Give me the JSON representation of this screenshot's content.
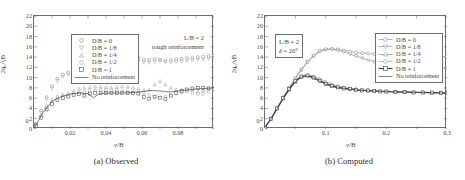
{
  "figure": {
    "panels": [
      {
        "id": "observed",
        "caption": "(a) Observed",
        "annotations": [
          "L/B = 2",
          "rough reinforcement"
        ],
        "axes": {
          "ylabel_main": "2q",
          "ylabel_sub": "u",
          "ylabel_tail": "/γB",
          "xlabel_main": "v",
          "xlabel_tail": "/B",
          "yticks": [
            0,
            2,
            4,
            6,
            8,
            10,
            12,
            14,
            16,
            18,
            20,
            22
          ],
          "xticks": [
            "0.02",
            "0.04",
            "0.06",
            "0.08"
          ]
        },
        "legend": [
          {
            "label": "D/B = 0",
            "marker": "circle",
            "line": false
          },
          {
            "label": "D/B = 1/8",
            "marker": "triangle-down",
            "line": false
          },
          {
            "label": "D/B = 1/4",
            "marker": "triangle-up",
            "line": false
          },
          {
            "label": "D/B = 1/2",
            "marker": "circle",
            "line": false
          },
          {
            "label": "D/B = 1",
            "marker": "square",
            "line": false
          },
          {
            "label": "No reinforcement",
            "marker": "none",
            "line": true
          }
        ]
      },
      {
        "id": "computed",
        "caption": "(b) Computed",
        "annotations": [
          "L/B = 2",
          "δ = 20°"
        ],
        "axes": {
          "ylabel_main": "2q",
          "ylabel_sub": "u",
          "ylabel_tail": "/γB",
          "xlabel_main": "v",
          "xlabel_tail": "/B",
          "yticks": [
            0,
            2,
            4,
            6,
            8,
            10,
            12,
            14,
            16,
            18,
            20,
            22
          ],
          "xticks": [
            "0.1",
            "0.2",
            "0.3"
          ]
        },
        "legend": [
          {
            "label": "D/B = 0",
            "marker": "circle",
            "line": true
          },
          {
            "label": "D/B = 1/8",
            "marker": "triangle-down",
            "line": true
          },
          {
            "label": "D/B = 1/4",
            "marker": "triangle-up",
            "line": true
          },
          {
            "label": "D/B = 1/2",
            "marker": "circle",
            "line": true
          },
          {
            "label": "D/B = 1",
            "marker": "square",
            "line": true
          },
          {
            "label": "No reinforcement",
            "marker": "none",
            "line": true
          }
        ]
      }
    ]
  },
  "chart_data": [
    {
      "type": "scatter",
      "panel": "(a) Observed",
      "title": "",
      "xlabel": "v/B",
      "ylabel": "2q_u/γB",
      "xlim": [
        0,
        0.1
      ],
      "ylim": [
        0,
        22
      ],
      "xticks": [
        0.02,
        0.04,
        0.06,
        0.08
      ],
      "yticks": [
        0,
        2,
        4,
        6,
        8,
        10,
        12,
        14,
        16,
        18,
        20,
        22
      ],
      "grid": false,
      "legend_position": "top-left",
      "annotations": [
        "L/B = 2",
        "rough reinforcement"
      ],
      "series": [
        {
          "name": "D/B = 0",
          "marker": "circle",
          "color": "#8a8a8a",
          "x": [
            0.001,
            0.004,
            0.007,
            0.01,
            0.013,
            0.016,
            0.019,
            0.022,
            0.025,
            0.028,
            0.031,
            0.034,
            0.037,
            0.04,
            0.043,
            0.046,
            0.049,
            0.052,
            0.055,
            0.058,
            0.061,
            0.064,
            0.067,
            0.07,
            0.073,
            0.076,
            0.079,
            0.082,
            0.085,
            0.088,
            0.091,
            0.094,
            0.097,
            0.1
          ],
          "y": [
            1.0,
            3.6,
            6.2,
            8.3,
            9.8,
            10.6,
            11.0,
            11.3,
            11.6,
            11.8,
            12.0,
            12.2,
            12.3,
            12.5,
            12.6,
            12.8,
            13.0,
            13.1,
            13.2,
            13.4,
            13.5,
            13.5,
            13.6,
            13.4,
            13.2,
            13.4,
            13.6,
            13.7,
            13.8,
            13.9,
            14.0,
            14.1,
            14.2,
            14.3
          ]
        },
        {
          "name": "D/B = 1/8",
          "marker": "triangle-down",
          "color": "#9a9a9a",
          "x": [
            0.001,
            0.004,
            0.007,
            0.01,
            0.013,
            0.016,
            0.019,
            0.022,
            0.025,
            0.028,
            0.031,
            0.034,
            0.037,
            0.04,
            0.043,
            0.046,
            0.049,
            0.052,
            0.055,
            0.058,
            0.061,
            0.064,
            0.067,
            0.07,
            0.073,
            0.076,
            0.079,
            0.082,
            0.085,
            0.088,
            0.091,
            0.094,
            0.097,
            0.1
          ],
          "y": [
            0.9,
            3.2,
            5.8,
            7.9,
            9.4,
            10.2,
            10.6,
            10.9,
            11.2,
            11.4,
            11.6,
            11.8,
            11.9,
            12.1,
            12.3,
            12.5,
            12.7,
            12.8,
            13.0,
            13.8,
            13.0,
            12.9,
            13.1,
            13.5,
            13.2,
            13.0,
            13.1,
            13.2,
            13.3,
            13.4,
            13.5,
            13.6,
            13.7,
            13.8
          ]
        },
        {
          "name": "D/B = 1/4",
          "marker": "triangle-up",
          "color": "#9a9a9a",
          "x": [
            0.001,
            0.004,
            0.007,
            0.01,
            0.013,
            0.016,
            0.019,
            0.022,
            0.025,
            0.028,
            0.031,
            0.034,
            0.037,
            0.04,
            0.043,
            0.046,
            0.049,
            0.052,
            0.055,
            0.058,
            0.061,
            0.064,
            0.067,
            0.07,
            0.073,
            0.076,
            0.079,
            0.082,
            0.085,
            0.088,
            0.091,
            0.094,
            0.097,
            0.1
          ],
          "y": [
            0.8,
            2.8,
            4.6,
            5.8,
            6.4,
            6.7,
            6.9,
            7.4,
            7.8,
            8.0,
            8.1,
            8.2,
            8.2,
            8.1,
            8.0,
            8.1,
            8.2,
            8.2,
            8.0,
            7.8,
            7.5,
            7.6,
            8.6,
            9.3,
            8.6,
            8.0,
            7.7,
            7.6,
            7.5,
            7.4,
            7.3,
            7.5,
            7.8,
            8.0
          ]
        },
        {
          "name": "D/B = 1/2",
          "marker": "circle",
          "color": "#a5a5a5",
          "x": [
            0.001,
            0.004,
            0.007,
            0.01,
            0.013,
            0.016,
            0.019,
            0.022,
            0.025,
            0.028,
            0.031,
            0.034,
            0.037,
            0.04,
            0.043,
            0.046,
            0.049,
            0.052,
            0.055,
            0.058,
            0.061,
            0.064,
            0.067,
            0.07,
            0.073,
            0.076,
            0.079,
            0.082,
            0.085,
            0.088,
            0.091,
            0.094,
            0.097,
            0.1
          ],
          "y": [
            0.7,
            2.4,
            4.0,
            5.1,
            5.8,
            6.2,
            6.5,
            6.8,
            7.0,
            7.2,
            7.4,
            7.5,
            7.6,
            7.6,
            7.5,
            7.4,
            7.3,
            7.2,
            7.1,
            7.0,
            7.0,
            6.6,
            6.2,
            6.1,
            6.3,
            6.6,
            6.9,
            7.1,
            7.3,
            7.0,
            6.8,
            6.9,
            7.2,
            7.5
          ]
        },
        {
          "name": "D/B = 1",
          "marker": "square",
          "color": "#555555",
          "x": [
            0.001,
            0.004,
            0.007,
            0.01,
            0.013,
            0.016,
            0.019,
            0.022,
            0.025,
            0.028,
            0.031,
            0.034,
            0.037,
            0.04,
            0.043,
            0.046,
            0.049,
            0.052,
            0.055,
            0.058,
            0.061,
            0.064,
            0.067,
            0.07,
            0.073,
            0.076,
            0.079,
            0.082,
            0.085,
            0.088,
            0.091,
            0.094,
            0.097,
            0.1
          ],
          "y": [
            0.6,
            2.2,
            3.8,
            4.9,
            5.6,
            6.0,
            6.3,
            6.6,
            6.8,
            6.5,
            6.9,
            7.0,
            7.0,
            7.0,
            7.0,
            7.0,
            7.0,
            7.0,
            7.0,
            6.9,
            6.2,
            5.9,
            6.3,
            6.1,
            5.8,
            6.5,
            7.0,
            7.4,
            7.7,
            7.9,
            8.0,
            8.0,
            7.9,
            7.8
          ]
        },
        {
          "name": "No reinforcement",
          "marker": "none",
          "color": "#4a4a4a",
          "style": "line",
          "x": [
            0.0,
            0.005,
            0.01,
            0.015,
            0.02,
            0.025,
            0.03,
            0.033,
            0.036,
            0.04,
            0.045,
            0.05,
            0.055,
            0.06,
            0.065,
            0.07,
            0.075,
            0.08,
            0.085,
            0.09,
            0.095,
            0.1
          ],
          "y": [
            0.0,
            3.2,
            5.4,
            6.3,
            6.8,
            7.0,
            6.9,
            6.1,
            6.8,
            7.0,
            7.0,
            7.0,
            7.1,
            7.3,
            7.5,
            7.4,
            7.2,
            7.4,
            7.6,
            7.8,
            7.9,
            8.0
          ]
        }
      ]
    },
    {
      "type": "line",
      "panel": "(b) Computed",
      "title": "",
      "xlabel": "v/B",
      "ylabel": "2q_u/γB",
      "xlim": [
        0,
        0.3
      ],
      "ylim": [
        0,
        22
      ],
      "xticks": [
        0.1,
        0.2,
        0.3
      ],
      "yticks": [
        0,
        2,
        4,
        6,
        8,
        10,
        12,
        14,
        16,
        18,
        20,
        22
      ],
      "grid": false,
      "legend_position": "top-right",
      "annotations": [
        "L/B = 2",
        "δ = 20°"
      ],
      "series": [
        {
          "name": "D/B = 0",
          "marker": "circle",
          "color": "#8f8f8f",
          "x": [
            0.0,
            0.01,
            0.02,
            0.03,
            0.04,
            0.05,
            0.06,
            0.07,
            0.08,
            0.09,
            0.1,
            0.11,
            0.12,
            0.13,
            0.14,
            0.15,
            0.16,
            0.17,
            0.18,
            0.19,
            0.2,
            0.215,
            0.23,
            0.245,
            0.26,
            0.275,
            0.29,
            0.3
          ],
          "y": [
            0.4,
            2.0,
            4.0,
            6.0,
            8.0,
            9.8,
            11.5,
            13.0,
            14.2,
            15.1,
            15.5,
            15.6,
            15.5,
            15.3,
            15.1,
            14.9,
            14.8,
            14.7,
            14.6,
            14.5,
            14.5,
            14.4,
            14.3,
            14.3,
            14.2,
            14.2,
            14.1,
            14.1
          ]
        },
        {
          "name": "D/B = 1/8",
          "marker": "triangle-down",
          "color": "#8f8f8f",
          "x": [
            0.0,
            0.01,
            0.02,
            0.03,
            0.04,
            0.05,
            0.06,
            0.07,
            0.08,
            0.09,
            0.1,
            0.11,
            0.12,
            0.13,
            0.14,
            0.15,
            0.16,
            0.17,
            0.18,
            0.19,
            0.2,
            0.215,
            0.23,
            0.245,
            0.26,
            0.275,
            0.29,
            0.3
          ],
          "y": [
            0.4,
            2.0,
            4.1,
            6.1,
            8.1,
            9.9,
            11.6,
            13.1,
            14.3,
            15.2,
            15.5,
            15.5,
            15.3,
            15.0,
            14.6,
            14.2,
            13.8,
            13.4,
            13.1,
            12.8,
            12.6,
            12.3,
            12.1,
            12.0,
            11.9,
            11.8,
            11.8,
            11.8
          ]
        },
        {
          "name": "D/B = 1/4",
          "marker": "triangle-up",
          "color": "#8f8f8f",
          "x": [
            0.0,
            0.01,
            0.02,
            0.03,
            0.04,
            0.05,
            0.06,
            0.07,
            0.08,
            0.09,
            0.1,
            0.11,
            0.12,
            0.13,
            0.14,
            0.15,
            0.16,
            0.17,
            0.18,
            0.19,
            0.2,
            0.215,
            0.23,
            0.245,
            0.26,
            0.275,
            0.29,
            0.3
          ],
          "y": [
            0.4,
            2.0,
            4.0,
            5.9,
            7.6,
            9.1,
            10.1,
            10.5,
            10.3,
            9.8,
            9.2,
            8.7,
            8.3,
            8.1,
            7.9,
            7.8,
            7.6,
            7.5,
            7.4,
            7.4,
            7.3,
            7.3,
            7.2,
            7.2,
            7.1,
            7.1,
            7.1,
            7.1
          ]
        },
        {
          "name": "D/B = 1/2",
          "marker": "circle",
          "color": "#a0a0a0",
          "x": [
            0.0,
            0.01,
            0.02,
            0.03,
            0.04,
            0.05,
            0.06,
            0.07,
            0.08,
            0.09,
            0.1,
            0.11,
            0.12,
            0.13,
            0.14,
            0.15,
            0.16,
            0.17,
            0.18,
            0.19,
            0.2,
            0.215,
            0.23,
            0.245,
            0.26,
            0.275,
            0.29,
            0.3
          ],
          "y": [
            0.4,
            2.1,
            4.2,
            6.2,
            8.0,
            9.5,
            10.3,
            10.5,
            10.1,
            9.5,
            8.9,
            8.5,
            8.2,
            8.0,
            7.8,
            7.7,
            7.6,
            7.5,
            7.4,
            7.4,
            7.3,
            7.3,
            7.2,
            7.2,
            7.2,
            7.1,
            7.1,
            7.1
          ]
        },
        {
          "name": "D/B = 1",
          "marker": "square",
          "color": "#3f3f3f",
          "x": [
            0.0,
            0.01,
            0.02,
            0.03,
            0.04,
            0.05,
            0.06,
            0.07,
            0.08,
            0.09,
            0.1,
            0.11,
            0.12,
            0.13,
            0.14,
            0.15,
            0.16,
            0.17,
            0.18,
            0.19,
            0.2,
            0.215,
            0.23,
            0.245,
            0.26,
            0.275,
            0.29,
            0.3
          ],
          "y": [
            0.3,
            2.0,
            4.0,
            6.0,
            7.8,
            9.3,
            10.2,
            10.4,
            10.0,
            9.4,
            8.8,
            8.4,
            8.1,
            7.9,
            7.8,
            7.6,
            7.5,
            7.5,
            7.4,
            7.3,
            7.3,
            7.2,
            7.2,
            7.1,
            7.1,
            7.1,
            7.0,
            7.0
          ]
        },
        {
          "name": "No reinforcement",
          "marker": "none",
          "color": "#4a4a4a",
          "style": "line",
          "x": [
            0.0,
            0.01,
            0.02,
            0.03,
            0.04,
            0.05,
            0.06,
            0.07,
            0.08,
            0.09,
            0.1,
            0.11,
            0.12,
            0.13,
            0.14,
            0.15,
            0.16,
            0.17,
            0.18,
            0.19,
            0.2,
            0.215,
            0.23,
            0.245,
            0.26,
            0.275,
            0.29,
            0.3
          ],
          "y": [
            0.3,
            1.9,
            3.9,
            5.9,
            7.7,
            9.2,
            10.1,
            10.3,
            9.9,
            9.3,
            8.7,
            8.3,
            8.0,
            7.9,
            7.7,
            7.6,
            7.5,
            7.4,
            7.4,
            7.3,
            7.3,
            7.2,
            7.2,
            7.1,
            7.1,
            7.0,
            7.0,
            7.0
          ]
        }
      ]
    }
  ]
}
